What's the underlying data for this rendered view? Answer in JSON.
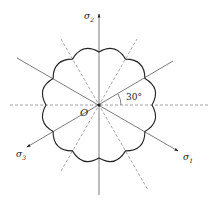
{
  "diagram": {
    "origin_label": "O",
    "angle_label": "30°",
    "axes": [
      {
        "name": "σ1",
        "symbol": "σ",
        "subscript": "1",
        "direction_deg": -30
      },
      {
        "name": "σ2",
        "symbol": "σ",
        "subscript": "2",
        "direction_deg": 90
      },
      {
        "name": "σ3",
        "symbol": "σ",
        "subscript": "3",
        "direction_deg": 210
      }
    ],
    "curve": {
      "type": "scalloped-closed-curve",
      "lobes": 12
    },
    "line_color": "#222222",
    "dashed_color": "#555555"
  }
}
